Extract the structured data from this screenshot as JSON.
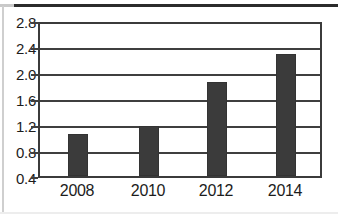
{
  "chart_data": {
    "type": "bar",
    "title": "",
    "subtitle": "",
    "xlabel": "",
    "ylabel": "",
    "categories": [
      "2008",
      "2010",
      "2012",
      "2014"
    ],
    "values": [
      1.06,
      1.19,
      1.88,
      2.32
    ],
    "series": [
      {
        "name": "",
        "values": [
          1.06,
          1.19,
          1.88,
          2.32
        ]
      }
    ],
    "ylim": [
      0.4,
      2.8
    ],
    "yticks": [
      "0.4",
      "0.8",
      "1.2",
      "1.6",
      "2.0",
      "2.4",
      "2.8"
    ],
    "ytick_values": [
      0.4,
      0.8,
      1.2,
      1.6,
      2.0,
      2.4,
      2.8
    ],
    "xticks": [
      "2008",
      "2010",
      "2012",
      "2014"
    ],
    "grid": true,
    "grid_axis": "y",
    "legend": false,
    "legend_position": "none",
    "annotations": [],
    "colors": {
      "bar_fill": "#3b3b3b",
      "axis": "#3b3b3b",
      "grid": "#3f3f3f",
      "text": "#1c1c1c",
      "background": "#ffffff"
    }
  },
  "axis": {
    "y_tick_labels": [
      "2.8",
      "2.4",
      "2.0",
      "1.6",
      "1.2",
      "0.8",
      "0.4"
    ],
    "x_tick_labels": [
      "2008",
      "2010",
      "2012",
      "2014"
    ]
  }
}
